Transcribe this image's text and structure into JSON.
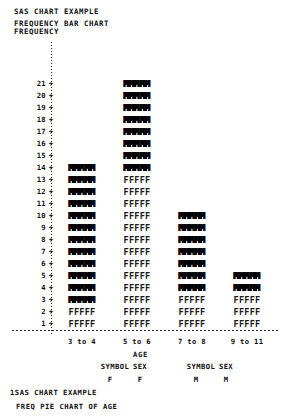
{
  "header": {
    "report_title": "SAS CHART EXAMPLE",
    "chart_title": "FREQUENCY BAR CHART",
    "y_axis_name": "FREQUENCY"
  },
  "footer": {
    "line1": "1SAS CHART EXAMPLE",
    "line2": "FREQ PIE CHART OF AGE"
  },
  "legend": {
    "groups": [
      {
        "header_symbol": "SYMBOL",
        "header_value": "SEX",
        "symbol": "F",
        "value": "F"
      },
      {
        "header_symbol": "SYMBOL",
        "header_value": "SEX",
        "symbol": "M",
        "value": "M"
      }
    ]
  },
  "axis": {
    "x_name": "AGE",
    "y_ticks": [
      21,
      20,
      19,
      18,
      17,
      16,
      15,
      14,
      13,
      12,
      11,
      10,
      9,
      8,
      7,
      6,
      5,
      4,
      3,
      2,
      1
    ],
    "tick_mark": "+"
  },
  "chart_data": {
    "type": "bar",
    "title": "FREQUENCY BAR CHART",
    "subtitle": "SAS CHART EXAMPLE",
    "xlabel": "AGE",
    "ylabel": "FREQUENCY",
    "ylim": [
      0,
      21
    ],
    "grid": false,
    "stacked": true,
    "legend_position": "bottom",
    "categories": [
      "3 to 4",
      "5 to 6",
      "7 to 8",
      "9 to 11"
    ],
    "series": [
      {
        "name": "F",
        "symbol": "F",
        "values": [
          2,
          13,
          3,
          3
        ]
      },
      {
        "name": "M",
        "symbol": "M",
        "values": [
          12,
          8,
          7,
          2
        ]
      }
    ],
    "totals": [
      14,
      21,
      10,
      5
    ]
  }
}
